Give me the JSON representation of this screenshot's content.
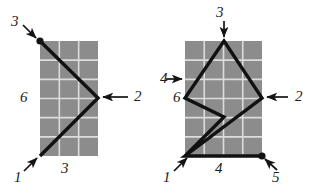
{
  "figure": {
    "background_color": "#ffffff",
    "grid_fill_color": "#8c8c8c",
    "grid_line_color": "#dcdcdc",
    "path_color": "#111111",
    "label_color": "#1a1a1a"
  },
  "left_figure": {
    "name": "left-grid-diagram",
    "grid": {
      "columns": 3,
      "rows": 6,
      "x": 40,
      "y": 41,
      "width": 58,
      "height": 115
    },
    "path_points": "40,41 98,98 40,156",
    "endpoint_dot": {
      "cx": 40,
      "cy": 41,
      "r": 3.6
    },
    "labels": [
      {
        "name": "label-3-top",
        "text": "3",
        "x": 11,
        "y": 14
      },
      {
        "name": "label-2-right",
        "text": "2",
        "x": 134,
        "y": 89
      },
      {
        "name": "label-6-left",
        "text": "6",
        "x": 20,
        "y": 90
      },
      {
        "name": "label-3-bottom",
        "text": "3",
        "x": 61,
        "y": 161
      },
      {
        "name": "label-1-bottom",
        "text": "1",
        "x": 14,
        "y": 170
      }
    ],
    "arrows": [
      {
        "name": "arrow-to-3-top",
        "x1": 23,
        "y1": 25,
        "x2": 36,
        "y2": 38
      },
      {
        "name": "arrow-to-2-right",
        "x1": 128,
        "y1": 97,
        "x2": 103,
        "y2": 97
      },
      {
        "name": "arrow-to-1-bottom",
        "x1": 24,
        "y1": 171,
        "x2": 37,
        "y2": 158
      }
    ]
  },
  "right_figure": {
    "name": "right-grid-diagram",
    "grid": {
      "columns": 4,
      "rows": 6,
      "x": 185,
      "y": 41,
      "width": 77,
      "height": 115
    },
    "path_points": "185,156 224,117 185,98 224,41 262,98 185,156 262,156",
    "endpoint_dot": {
      "cx": 262,
      "cy": 156,
      "r": 3.6
    },
    "labels": [
      {
        "name": "label-3-top",
        "text": "3",
        "x": 216,
        "y": 5
      },
      {
        "name": "label-2-right",
        "text": "2",
        "x": 295,
        "y": 89
      },
      {
        "name": "label-4-left",
        "text": "4",
        "x": 160,
        "y": 71
      },
      {
        "name": "label-6-left",
        "text": "6",
        "x": 173,
        "y": 90
      },
      {
        "name": "label-4-bottom",
        "text": "4",
        "x": 215,
        "y": 161
      },
      {
        "name": "label-1-bottom",
        "text": "1",
        "x": 163,
        "y": 170
      },
      {
        "name": "label-5-bottom",
        "text": "5",
        "x": 272,
        "y": 170
      }
    ],
    "arrows": [
      {
        "name": "arrow-to-3-top",
        "x1": 224,
        "y1": 21,
        "x2": 224,
        "y2": 37
      },
      {
        "name": "arrow-to-2-right",
        "x1": 288,
        "y1": 97,
        "x2": 267,
        "y2": 97
      },
      {
        "name": "arrow-to-4-left",
        "x1": 166,
        "y1": 79,
        "x2": 182,
        "y2": 79
      },
      {
        "name": "arrow-to-1-bottom",
        "x1": 174,
        "y1": 171,
        "x2": 187,
        "y2": 158
      },
      {
        "name": "arrow-to-5-bottom",
        "x1": 277,
        "y1": 170,
        "x2": 265,
        "y2": 159
      }
    ]
  }
}
